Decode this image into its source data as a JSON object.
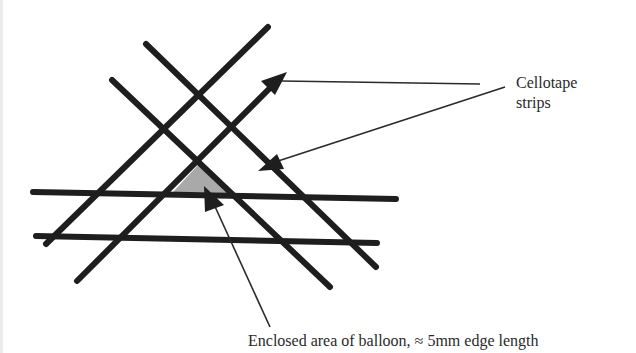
{
  "labels": {
    "cellotape_line1": "Cellotape",
    "cellotape_line2": "strips",
    "enclosed": "Enclosed area of balloon,  ≈ 5mm edge length"
  },
  "colors": {
    "strip": "#1e1e1e",
    "leader": "#2a2a2a",
    "enclosed_fill": "#a9a9a9",
    "background": "#ffffff"
  }
}
